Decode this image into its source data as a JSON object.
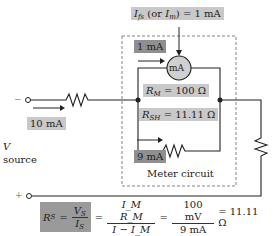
{
  "diagram": {
    "full_scale_label": "I_fs (or I_m) = 1 mA",
    "full_scale": {
      "symbol": "I",
      "sub": "fs",
      "alt_symbol": "I",
      "alt_sub": "m",
      "value": "= 1 mA",
      "alt_prefix": "(or ",
      "alt_suffix": ")"
    },
    "meter_current": "1 mA",
    "meter_symbol": "mA",
    "rm": {
      "symbol": "R",
      "sub": "M",
      "value": "= 100 Ω"
    },
    "rsh": {
      "symbol": "R",
      "sub": "SH",
      "value": "= 11.11 Ω"
    },
    "shunt_current": "9 mA",
    "total_current": "10 mA",
    "source_symbol": "V",
    "source_label": "source",
    "meter_circuit_label": "Meter circuit",
    "terminal_minus": "−",
    "terminal_plus": "+",
    "equation": {
      "lhs": {
        "symbol": "R",
        "sub": "S"
      },
      "f1_num": {
        "symbol": "V",
        "sub": "S"
      },
      "f1_den": {
        "symbol": "I",
        "sub": "S"
      },
      "f2_num": "I_M R_M",
      "f2_den": "I − I_M",
      "f3_num": "100 mV",
      "f3_den": "9 mA",
      "result": "= 11.11 Ω"
    },
    "colors": {
      "highlight_light": "#c9c9c9",
      "highlight_dark": "#8f8f8f",
      "meter_fill": "#d0d0d0",
      "wire": "#222222"
    }
  }
}
